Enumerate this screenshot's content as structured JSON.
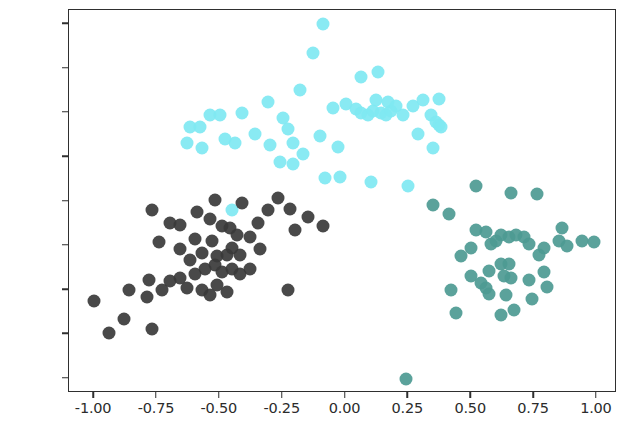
{
  "chart_data": {
    "type": "scatter",
    "title": "",
    "xlabel": "",
    "ylabel": "",
    "xlim": [
      -1.1,
      1.08
    ],
    "ylim": [
      -1.08,
      1.08
    ],
    "grid": false,
    "legend": null,
    "x_ticks": [
      -1.0,
      -0.75,
      -0.5,
      -0.25,
      0.0,
      0.25,
      0.5,
      0.75,
      1.0
    ],
    "x_tick_labels": [
      "-1.00",
      "-0.75",
      "-0.50",
      "-0.25",
      "0.00",
      "0.25",
      "0.50",
      "0.75",
      "1.00"
    ],
    "y_ticks": [
      1.0,
      0.75,
      0.5,
      0.25,
      0.0,
      -0.25,
      -0.5,
      -0.75,
      -1.0
    ],
    "y_tick_labels": [
      "1.00",
      "0.75",
      "0.50",
      "0.25",
      "0.00",
      "-0.25",
      "-0.50",
      "-0.75",
      "-1.00"
    ],
    "marker_size": 13,
    "series": [
      {
        "name": "cluster-cyan",
        "color": "#7fe8f2",
        "points": [
          [
            -0.09,
            1.0
          ],
          [
            -0.13,
            0.84
          ],
          [
            -0.18,
            0.63
          ],
          [
            0.06,
            0.7
          ],
          [
            0.13,
            0.73
          ],
          [
            -0.31,
            0.56
          ],
          [
            -0.25,
            0.47
          ],
          [
            -0.41,
            0.5
          ],
          [
            -0.54,
            0.49
          ],
          [
            -0.62,
            0.42
          ],
          [
            -0.58,
            0.42
          ],
          [
            -0.63,
            0.33
          ],
          [
            -0.57,
            0.3
          ],
          [
            -0.44,
            0.33
          ],
          [
            -0.36,
            0.38
          ],
          [
            -0.3,
            0.32
          ],
          [
            -0.23,
            0.41
          ],
          [
            -0.21,
            0.33
          ],
          [
            -0.17,
            0.27
          ],
          [
            -0.26,
            0.22
          ],
          [
            -0.21,
            0.21
          ],
          [
            -0.1,
            0.37
          ],
          [
            -0.05,
            0.53
          ],
          [
            0.0,
            0.55
          ],
          [
            0.04,
            0.52
          ],
          [
            0.06,
            0.5
          ],
          [
            0.09,
            0.49
          ],
          [
            0.11,
            0.51
          ],
          [
            0.14,
            0.5
          ],
          [
            0.16,
            0.49
          ],
          [
            0.18,
            0.51
          ],
          [
            0.12,
            0.57
          ],
          [
            0.17,
            0.56
          ],
          [
            0.2,
            0.54
          ],
          [
            0.23,
            0.49
          ],
          [
            0.27,
            0.54
          ],
          [
            0.31,
            0.57
          ],
          [
            0.34,
            0.49
          ],
          [
            0.36,
            0.45
          ],
          [
            0.37,
            0.43
          ],
          [
            0.38,
            0.42
          ],
          [
            0.35,
            0.3
          ],
          [
            0.37,
            0.58
          ],
          [
            0.29,
            0.38
          ],
          [
            -0.03,
            0.31
          ],
          [
            -0.02,
            0.14
          ],
          [
            0.1,
            0.11
          ],
          [
            0.25,
            0.09
          ],
          [
            -0.5,
            0.49
          ],
          [
            -0.48,
            0.35
          ],
          [
            -0.08,
            0.13
          ],
          [
            -0.45,
            -0.05
          ]
        ]
      },
      {
        "name": "cluster-dark",
        "color": "#3a3a3a",
        "points": [
          [
            -0.52,
            0.01
          ],
          [
            -0.41,
            -0.01
          ],
          [
            -0.27,
            0.02
          ],
          [
            -0.22,
            -0.04
          ],
          [
            -0.15,
            -0.09
          ],
          [
            -0.09,
            -0.14
          ],
          [
            -0.77,
            -0.05
          ],
          [
            -0.7,
            -0.12
          ],
          [
            -0.66,
            -0.13
          ],
          [
            -0.59,
            -0.06
          ],
          [
            -0.54,
            -0.1
          ],
          [
            -0.49,
            -0.14
          ],
          [
            -0.46,
            -0.15
          ],
          [
            -0.43,
            -0.19
          ],
          [
            -0.38,
            -0.2
          ],
          [
            -0.45,
            -0.26
          ],
          [
            -0.47,
            -0.3
          ],
          [
            -0.74,
            -0.23
          ],
          [
            -0.66,
            -0.27
          ],
          [
            -0.62,
            -0.33
          ],
          [
            -0.57,
            -0.29
          ],
          [
            -0.51,
            -0.31
          ],
          [
            -0.52,
            -0.36
          ],
          [
            -0.56,
            -0.38
          ],
          [
            -0.49,
            -0.4
          ],
          [
            -0.45,
            -0.38
          ],
          [
            -0.42,
            -0.41
          ],
          [
            -0.38,
            -0.38
          ],
          [
            -0.6,
            -0.41
          ],
          [
            -0.66,
            -0.43
          ],
          [
            -0.7,
            -0.45
          ],
          [
            -0.78,
            -0.44
          ],
          [
            -0.63,
            -0.49
          ],
          [
            -0.57,
            -0.5
          ],
          [
            -0.51,
            -0.47
          ],
          [
            -0.47,
            -0.51
          ],
          [
            -0.73,
            -0.5
          ],
          [
            -0.79,
            -0.54
          ],
          [
            -0.86,
            -0.5
          ],
          [
            -1.0,
            -0.56
          ],
          [
            -0.88,
            -0.66
          ],
          [
            -0.94,
            -0.74
          ],
          [
            -0.77,
            -0.72
          ],
          [
            -0.54,
            -0.53
          ],
          [
            -0.23,
            -0.5
          ],
          [
            -0.2,
            -0.16
          ],
          [
            -0.31,
            -0.05
          ],
          [
            -0.35,
            -0.12
          ],
          [
            -0.6,
            -0.21
          ],
          [
            -0.53,
            -0.22
          ],
          [
            -0.42,
            -0.3
          ],
          [
            -0.34,
            -0.27
          ]
        ]
      },
      {
        "name": "cluster-teal",
        "color": "#4d9a93",
        "points": [
          [
            0.52,
            0.09
          ],
          [
            0.66,
            0.05
          ],
          [
            0.76,
            0.04
          ],
          [
            0.41,
            -0.07
          ],
          [
            0.52,
            -0.16
          ],
          [
            0.56,
            -0.17
          ],
          [
            0.62,
            -0.19
          ],
          [
            0.65,
            -0.2
          ],
          [
            0.68,
            -0.19
          ],
          [
            0.71,
            -0.2
          ],
          [
            0.6,
            -0.22
          ],
          [
            0.58,
            -0.24
          ],
          [
            0.86,
            -0.15
          ],
          [
            0.85,
            -0.22
          ],
          [
            0.94,
            -0.22
          ],
          [
            0.99,
            -0.23
          ],
          [
            0.73,
            -0.24
          ],
          [
            0.79,
            -0.26
          ],
          [
            0.5,
            -0.26
          ],
          [
            0.46,
            -0.31
          ],
          [
            0.77,
            -0.3
          ],
          [
            0.62,
            -0.35
          ],
          [
            0.65,
            -0.35
          ],
          [
            0.57,
            -0.39
          ],
          [
            0.63,
            -0.42
          ],
          [
            0.66,
            -0.43
          ],
          [
            0.5,
            -0.42
          ],
          [
            0.79,
            -0.4
          ],
          [
            0.73,
            -0.44
          ],
          [
            0.54,
            -0.46
          ],
          [
            0.56,
            -0.49
          ],
          [
            0.57,
            -0.52
          ],
          [
            0.8,
            -0.48
          ],
          [
            0.42,
            -0.5
          ],
          [
            0.64,
            -0.53
          ],
          [
            0.74,
            -0.55
          ],
          [
            0.44,
            -0.63
          ],
          [
            0.67,
            -0.61
          ],
          [
            0.62,
            -0.64
          ],
          [
            0.24,
            -1.0
          ],
          [
            0.88,
            -0.25
          ],
          [
            0.35,
            -0.02
          ]
        ]
      }
    ]
  }
}
